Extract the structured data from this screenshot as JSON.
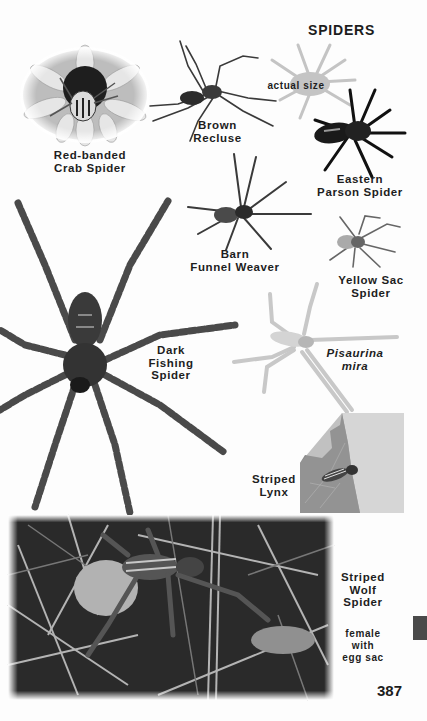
{
  "page": {
    "section_title": "SPIDERS",
    "page_number": "387",
    "side_tab_color": "#4a4a4a"
  },
  "specimens": [
    {
      "id": "red-banded-crab-spider",
      "label_lines": [
        "Red-banded",
        "Crab Spider"
      ],
      "image": "photo on flower"
    },
    {
      "id": "brown-recluse",
      "label_lines": [
        "Brown",
        "Recluse"
      ],
      "image": "cutout"
    },
    {
      "id": "actual-size",
      "label_lines": [
        "actual size"
      ],
      "image": "gray silhouette"
    },
    {
      "id": "eastern-parson-spider",
      "label_lines": [
        "Eastern",
        "Parson Spider"
      ],
      "image": "cutout"
    },
    {
      "id": "barn-funnel-weaver",
      "label_lines": [
        "Barn",
        "Funnel Weaver"
      ],
      "image": "cutout"
    },
    {
      "id": "yellow-sac-spider",
      "label_lines": [
        "Yellow Sac",
        "Spider"
      ],
      "image": "cutout"
    },
    {
      "id": "dark-fishing-spider",
      "label_lines": [
        "Dark",
        "Fishing",
        "Spider"
      ],
      "image": "cutout"
    },
    {
      "id": "pisaurina-mira",
      "label_lines": [
        "Pisaurina",
        "mira"
      ],
      "image": "cutout",
      "italic": true
    },
    {
      "id": "striped-lynx",
      "label_lines": [
        "Striped",
        "Lynx"
      ],
      "image": "photo on leaf"
    },
    {
      "id": "striped-wolf-spider",
      "label_lines": [
        "Striped",
        "Wolf",
        "Spider"
      ],
      "image": "photo in grass"
    },
    {
      "id": "striped-wolf-spider-caption",
      "label_lines": [
        "female",
        "with",
        "egg sac"
      ]
    }
  ]
}
